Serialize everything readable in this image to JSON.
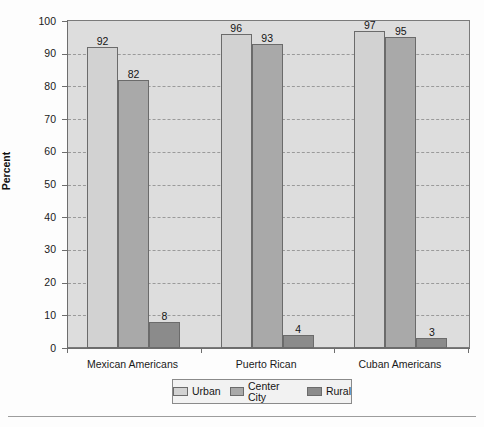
{
  "chart_data": {
    "type": "bar",
    "title": "",
    "xlabel": "",
    "ylabel": "Percent",
    "ylim": [
      0,
      100
    ],
    "yticks": [
      0,
      10,
      20,
      30,
      40,
      50,
      60,
      70,
      80,
      90,
      100
    ],
    "grid": true,
    "legend_position": "bottom",
    "categories": [
      "Mexican Americans",
      "Puerto Rican",
      "Cuban Americans"
    ],
    "series": [
      {
        "name": "Urban",
        "values": [
          92,
          96,
          97
        ],
        "color": "#d2d2d2"
      },
      {
        "name": "Center City",
        "values": [
          82,
          93,
          95
        ],
        "color": "#a9a9a9"
      },
      {
        "name": "Rural",
        "values": [
          8,
          4,
          3
        ],
        "color": "#8b8b8b"
      }
    ]
  },
  "axis": {
    "y_title": "Percent",
    "tick_labels": [
      "100",
      "90",
      "80",
      "70",
      "60",
      "50",
      "40",
      "30",
      "20",
      "10",
      "0"
    ]
  },
  "legend": {
    "items": [
      {
        "label": "Urban"
      },
      {
        "label": "Center City"
      },
      {
        "label": "Rural"
      }
    ]
  }
}
